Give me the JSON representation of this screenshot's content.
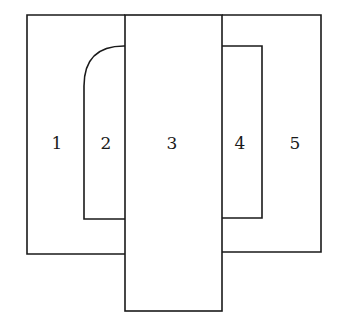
{
  "diagram": {
    "stroke_color": "#1a1a1a",
    "background": "#ffffff",
    "regions": [
      {
        "id": "1",
        "label": "1"
      },
      {
        "id": "2",
        "label": "2"
      },
      {
        "id": "3",
        "label": "3"
      },
      {
        "id": "4",
        "label": "4"
      },
      {
        "id": "5",
        "label": "5"
      }
    ]
  }
}
